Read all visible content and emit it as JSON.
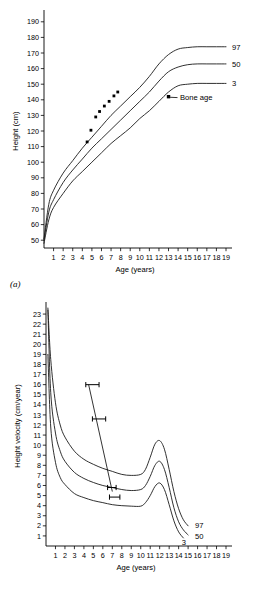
{
  "figure": {
    "panels": [
      {
        "caption": "(a)",
        "id": "panel-a"
      },
      {
        "caption": "(b)",
        "id": "panel-b"
      }
    ]
  },
  "chart_data": [
    {
      "type": "line",
      "id": "height-for-age",
      "panel": "(a)",
      "title": "",
      "xlabel": "Age (years)",
      "ylabel": "Height (cm)",
      "xlim": [
        0,
        19
      ],
      "ylim": [
        45,
        195
      ],
      "grid": false,
      "legend_position": "right-of-curve-ends",
      "xticks": [
        1,
        2,
        3,
        4,
        5,
        6,
        7,
        8,
        9,
        10,
        11,
        12,
        13,
        14,
        15,
        16,
        17,
        18,
        19
      ],
      "yticks": [
        50,
        60,
        70,
        80,
        90,
        100,
        110,
        120,
        130,
        140,
        150,
        160,
        170,
        180,
        190
      ],
      "series": [
        {
          "name": "97",
          "label": "97",
          "x": [
            0,
            0.5,
            1,
            2,
            3,
            4,
            5,
            6,
            7,
            8,
            9,
            10,
            11,
            12,
            13,
            14,
            15,
            16,
            17,
            18,
            19
          ],
          "values": [
            51,
            73,
            82,
            93,
            101,
            109,
            116,
            123,
            130,
            136,
            142,
            148,
            155,
            163,
            169,
            172.5,
            173.5,
            174,
            174,
            174,
            174
          ]
        },
        {
          "name": "50",
          "label": "50",
          "x": [
            0,
            0.5,
            1,
            2,
            3,
            4,
            5,
            6,
            7,
            8,
            9,
            10,
            11,
            12,
            13,
            14,
            15,
            16,
            17,
            18,
            19
          ],
          "values": [
            50,
            68,
            76,
            87,
            95,
            102,
            109,
            115,
            121,
            127,
            133,
            139,
            145,
            152,
            158,
            161,
            162.5,
            163,
            163,
            163,
            163
          ]
        },
        {
          "name": "3",
          "label": "3",
          "x": [
            0,
            0.5,
            1,
            2,
            3,
            4,
            5,
            6,
            7,
            8,
            9,
            10,
            11,
            12,
            13,
            14,
            15,
            16,
            17,
            18,
            19
          ],
          "values": [
            48,
            63,
            71,
            80,
            88,
            94,
            100,
            106,
            112,
            117,
            122,
            128,
            133,
            139,
            145,
            149,
            150,
            150.5,
            150.5,
            150.5,
            150.5
          ]
        }
      ],
      "patient_points": {
        "name": "patient height measurements",
        "marker": "filled-square",
        "x": [
          4.5,
          4.9,
          5.4,
          5.8,
          6.3,
          6.8,
          7.3,
          7.7
        ],
        "values": [
          113,
          120.5,
          129,
          132.5,
          136,
          139,
          142.5,
          145
        ]
      },
      "annotations": [
        {
          "text": "Bone age",
          "marker": "filled-square",
          "x": 13.0,
          "y": 142.0,
          "label_x": 14.2,
          "label_y": 140.0
        }
      ]
    },
    {
      "type": "line",
      "id": "height-velocity-for-age",
      "panel": "(b)",
      "title": "",
      "xlabel": "Age (years)",
      "ylabel": "Height velocity (cm/year)",
      "xlim": [
        0,
        19
      ],
      "ylim": [
        0,
        23.8
      ],
      "grid": false,
      "legend_position": "right-of-curve-ends",
      "xticks": [
        1,
        2,
        3,
        4,
        5,
        6,
        7,
        8,
        9,
        10,
        11,
        12,
        13,
        14,
        15,
        16,
        17,
        18,
        19
      ],
      "yticks": [
        1,
        2,
        3,
        4,
        5,
        6,
        7,
        8,
        9,
        10,
        11,
        12,
        13,
        14,
        15,
        16,
        17,
        18,
        19,
        20,
        21,
        22,
        23
      ],
      "series": [
        {
          "name": "97",
          "label": "97",
          "x": [
            0.2,
            0.5,
            1,
            1.5,
            2,
            3,
            4,
            5,
            6,
            7,
            8,
            9,
            10,
            10.5,
            11,
            11.5,
            12,
            12.5,
            13,
            13.5,
            14,
            14.5,
            15
          ],
          "values": [
            23.6,
            18.5,
            14.2,
            12.0,
            10.8,
            9.4,
            8.6,
            8.1,
            7.7,
            7.4,
            7.1,
            7.0,
            7.1,
            7.6,
            8.8,
            10.1,
            10.45,
            9.6,
            7.6,
            5.4,
            3.7,
            2.6,
            2.0
          ]
        },
        {
          "name": "50",
          "label": "50",
          "x": [
            0.2,
            0.5,
            1,
            1.5,
            2,
            3,
            4,
            5,
            6,
            7,
            8,
            9,
            10,
            10.5,
            11,
            11.5,
            12,
            12.5,
            13,
            13.5,
            14,
            14.5,
            15
          ],
          "values": [
            23.4,
            15.2,
            11.2,
            9.4,
            8.4,
            7.3,
            6.7,
            6.3,
            6.0,
            5.8,
            5.6,
            5.5,
            5.6,
            6.0,
            6.9,
            8.0,
            8.4,
            7.6,
            5.8,
            3.8,
            2.4,
            1.6,
            1.1
          ]
        },
        {
          "name": "3",
          "label": "3",
          "x": [
            0.2,
            0.5,
            1,
            1.5,
            2,
            3,
            4,
            5,
            6,
            7,
            8,
            9,
            10,
            10.5,
            11,
            11.5,
            12,
            12.5,
            13,
            13.5,
            14,
            14.5
          ],
          "values": [
            19.0,
            11.8,
            8.3,
            6.8,
            6.1,
            5.2,
            4.8,
            4.5,
            4.3,
            4.1,
            4.0,
            3.95,
            3.95,
            4.3,
            5.0,
            5.9,
            6.25,
            5.6,
            4.1,
            2.5,
            1.4,
            0.8
          ]
        }
      ],
      "patient_velocity_bars": [
        {
          "name": "velocity-bar-1",
          "y": 16.0,
          "x_start": 4.2,
          "x_end": 5.6,
          "x_center": 4.9
        },
        {
          "name": "velocity-bar-2",
          "y": 12.6,
          "x_start": 4.9,
          "x_end": 6.3,
          "x_center": 5.6
        },
        {
          "name": "velocity-bar-3",
          "y": 5.8,
          "x_start": 6.5,
          "x_end": 7.4,
          "x_center": 6.95
        },
        {
          "name": "velocity-bar-4",
          "y": 4.85,
          "x_start": 6.7,
          "x_end": 7.8,
          "x_center": 7.25
        }
      ],
      "patient_trend_line": {
        "name": "velocity-trend-line",
        "x": [
          4.5,
          7.0
        ],
        "values": [
          16.0,
          5.4
        ]
      }
    }
  ]
}
